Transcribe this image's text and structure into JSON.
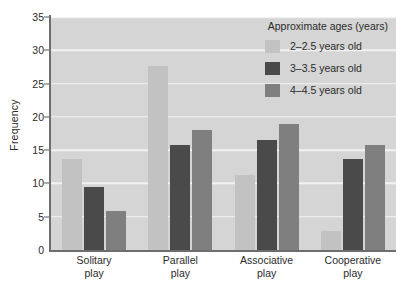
{
  "chart_data": {
    "type": "bar",
    "title": "",
    "xlabel": "",
    "ylabel": "Frequency",
    "ylim": [
      0,
      35
    ],
    "ytick_step": 5,
    "yticks": [
      0,
      5,
      10,
      15,
      20,
      25,
      30,
      35
    ],
    "grid": true,
    "grid_color": "#f2f2f2",
    "plot_background": "#d5d5d5",
    "legend_position": "top-right",
    "legend_title": "Approximate ages (years)",
    "categories": [
      "Solitary\nplay",
      "Parallel\nplay",
      "Associative\nplay",
      "Cooperative\nplay"
    ],
    "category_lines": [
      [
        "Solitary",
        "play"
      ],
      [
        "Parallel",
        "play"
      ],
      [
        "Associative",
        "play"
      ],
      [
        "Cooperative",
        "play"
      ]
    ],
    "series": [
      {
        "name": "2–2.5 years old",
        "color": "#c2c2c2",
        "values": [
          13.7,
          27.7,
          11.2,
          2.8
        ]
      },
      {
        "name": "3–3.5 years old",
        "color": "#4a4a4a",
        "values": [
          9.5,
          15.7,
          16.5,
          13.6
        ]
      },
      {
        "name": "4–4.5 years old",
        "color": "#7f7f7f",
        "values": [
          5.9,
          18.0,
          19.0,
          15.7
        ]
      }
    ]
  },
  "axis": {
    "y_title": "Frequency",
    "tick_labels": [
      "35",
      "30",
      "25",
      "20",
      "15",
      "10",
      "5",
      "0"
    ]
  },
  "legend": {
    "title": "Approximate ages (years)",
    "items": [
      {
        "label": "2–2.5 years old",
        "color": "#c2c2c2"
      },
      {
        "label": "3–3.5 years old",
        "color": "#4a4a4a"
      },
      {
        "label": "4–4.5 years old",
        "color": "#7f7f7f"
      }
    ]
  }
}
